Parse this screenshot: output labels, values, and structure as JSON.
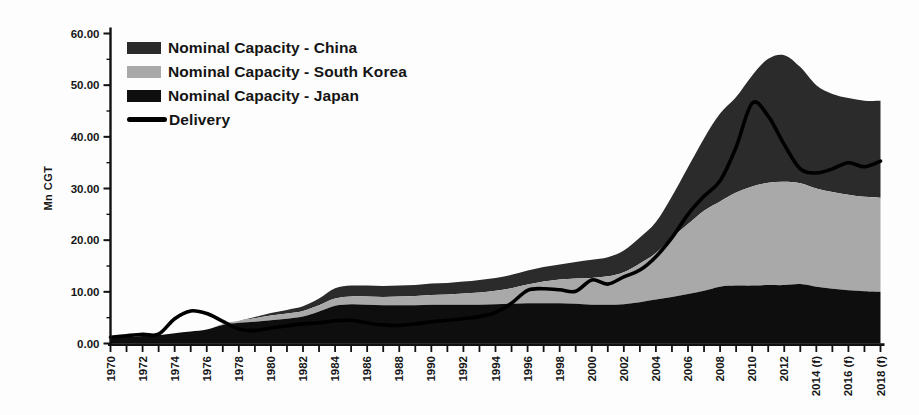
{
  "colors": {
    "china": "#2b2b2b",
    "south_korea": "#a9a9a9",
    "japan": "#0e0e0e",
    "delivery": "#000000",
    "axis": "#111111",
    "text": "#161616",
    "background": "#fdfdfd"
  },
  "legend": {
    "items": [
      {
        "key": "china",
        "label": "Nominal Capacity - China",
        "swatch": "area"
      },
      {
        "key": "south_korea",
        "label": "Nominal Capacity - South Korea",
        "swatch": "area"
      },
      {
        "key": "japan",
        "label": "Nominal Capacity - Japan",
        "swatch": "area"
      },
      {
        "key": "delivery",
        "label": "Delivery",
        "swatch": "line"
      }
    ]
  },
  "chart_data": {
    "type": "area",
    "title": "",
    "xlabel": "",
    "ylabel": "Mn CGT",
    "ylim": [
      0,
      60
    ],
    "legend_position": "top-left",
    "grid": false,
    "x": [
      1970,
      1971,
      1972,
      1973,
      1974,
      1975,
      1976,
      1977,
      1978,
      1979,
      1980,
      1981,
      1982,
      1983,
      1984,
      1985,
      1986,
      1987,
      1988,
      1989,
      1990,
      1991,
      1992,
      1993,
      1994,
      1995,
      1996,
      1997,
      1998,
      1999,
      2000,
      2001,
      2002,
      2003,
      2004,
      2005,
      2006,
      2007,
      2008,
      2009,
      2010,
      2011,
      2012,
      2013,
      2014,
      2015,
      2016,
      2017,
      2018
    ],
    "series": [
      {
        "key": "japan",
        "name": "Nominal Capacity - Japan",
        "kind": "stacked-area",
        "values": [
          1.2,
          1.3,
          1.45,
          1.6,
          2.0,
          2.3,
          2.7,
          3.6,
          4.0,
          4.2,
          4.5,
          4.8,
          5.2,
          6.2,
          7.3,
          7.6,
          7.5,
          7.4,
          7.4,
          7.4,
          7.5,
          7.5,
          7.5,
          7.5,
          7.6,
          7.7,
          7.8,
          7.8,
          7.8,
          7.7,
          7.5,
          7.5,
          7.6,
          8.0,
          8.5,
          9.0,
          9.6,
          10.2,
          11.0,
          11.2,
          11.2,
          11.3,
          11.3,
          11.5,
          11.0,
          10.6,
          10.3,
          10.1,
          10.0
        ]
      },
      {
        "key": "south_korea",
        "name": "Nominal Capacity - South Korea",
        "kind": "stacked-area",
        "values": [
          0,
          0,
          0,
          0,
          0,
          0,
          0,
          0.2,
          0.4,
          0.7,
          0.9,
          1.0,
          1.1,
          1.2,
          1.4,
          1.5,
          1.6,
          1.6,
          1.7,
          1.8,
          1.9,
          2.0,
          2.2,
          2.4,
          2.6,
          3.0,
          3.6,
          4.2,
          4.6,
          4.9,
          5.2,
          5.5,
          6.2,
          7.5,
          9.0,
          11.5,
          13.5,
          15.5,
          16.5,
          18.0,
          19.2,
          19.8,
          20.0,
          19.5,
          19.0,
          18.7,
          18.5,
          18.3,
          18.2
        ]
      },
      {
        "key": "china",
        "name": "Nominal Capacity - China",
        "kind": "stacked-area",
        "values": [
          0,
          0,
          0,
          0,
          0,
          0,
          0,
          0,
          0,
          0.2,
          0.5,
          0.7,
          0.9,
          1.3,
          2.0,
          2.1,
          2.1,
          2.1,
          2.1,
          2.1,
          2.2,
          2.2,
          2.3,
          2.4,
          2.5,
          2.6,
          2.7,
          2.8,
          2.9,
          3.2,
          3.5,
          3.7,
          4.2,
          5.0,
          6.0,
          8.0,
          11.0,
          14.0,
          17.0,
          18.5,
          21.5,
          24.0,
          24.5,
          22.5,
          20.0,
          19.0,
          18.7,
          18.6,
          18.8
        ]
      },
      {
        "key": "delivery",
        "name": "Delivery",
        "kind": "line",
        "values": [
          1.2,
          1.5,
          1.8,
          1.8,
          4.8,
          6.3,
          5.8,
          4.3,
          2.8,
          2.5,
          3.0,
          3.4,
          3.8,
          4.0,
          4.4,
          4.5,
          4.0,
          3.6,
          3.5,
          3.8,
          4.2,
          4.5,
          4.8,
          5.2,
          6.0,
          7.8,
          10.3,
          10.6,
          10.4,
          10.1,
          12.3,
          11.5,
          12.9,
          14.2,
          16.8,
          20.5,
          25.0,
          28.5,
          31.5,
          38.0,
          46.5,
          44.0,
          38.5,
          33.8,
          33.0,
          33.8,
          35.0,
          34.2,
          35.3
        ]
      }
    ],
    "y_ticks": [
      {
        "value": 0,
        "label": "0.00"
      },
      {
        "value": 10,
        "label": "10.00"
      },
      {
        "value": 20,
        "label": "20.00"
      },
      {
        "value": 30,
        "label": "30.00"
      },
      {
        "value": 40,
        "label": "40.00"
      },
      {
        "value": 50,
        "label": "50.00"
      },
      {
        "value": 60,
        "label": "60.00"
      }
    ],
    "y_minor_tick_step": 5,
    "x_tick_labels": [
      {
        "year": 1970,
        "label": "1970"
      },
      {
        "year": 1972,
        "label": "1972"
      },
      {
        "year": 1974,
        "label": "1974"
      },
      {
        "year": 1976,
        "label": "1976"
      },
      {
        "year": 1978,
        "label": "1978"
      },
      {
        "year": 1980,
        "label": "1980"
      },
      {
        "year": 1982,
        "label": "1982"
      },
      {
        "year": 1984,
        "label": "1984"
      },
      {
        "year": 1986,
        "label": "1986"
      },
      {
        "year": 1988,
        "label": "1988"
      },
      {
        "year": 1990,
        "label": "1990"
      },
      {
        "year": 1992,
        "label": "1992"
      },
      {
        "year": 1994,
        "label": "1994"
      },
      {
        "year": 1996,
        "label": "1996"
      },
      {
        "year": 1998,
        "label": "1998"
      },
      {
        "year": 2000,
        "label": "2000"
      },
      {
        "year": 2002,
        "label": "2002"
      },
      {
        "year": 2004,
        "label": "2004"
      },
      {
        "year": 2006,
        "label": "2006"
      },
      {
        "year": 2008,
        "label": "2008"
      },
      {
        "year": 2010,
        "label": "2010"
      },
      {
        "year": 2012,
        "label": "2012"
      },
      {
        "year": 2014,
        "label": "2014 (f)"
      },
      {
        "year": 2016,
        "label": "2016 (f)"
      },
      {
        "year": 2018,
        "label": "2018 (f)"
      }
    ]
  }
}
